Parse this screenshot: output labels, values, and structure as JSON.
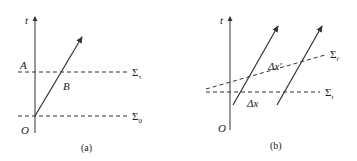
{
  "panels": [
    {
      "id": "a",
      "caption": "(a)",
      "axis_label": "t",
      "origin_label": "O",
      "point_A": "A",
      "point_B": "B",
      "surface_upper": {
        "symbol": "Σ",
        "sub": "τ"
      },
      "surface_lower": {
        "symbol": "Σ",
        "sub": "0"
      }
    },
    {
      "id": "b",
      "caption": "(b)",
      "axis_label": "t",
      "origin_label": "O",
      "delta_x": "Δx",
      "delta_x_prime": "Δx′",
      "surface_tilted": {
        "symbol": "Σ",
        "sub": "t′"
      },
      "surface_flat": {
        "symbol": "Σ",
        "sub": "t"
      }
    }
  ],
  "colors": {
    "line": "#333333",
    "text": "#222222",
    "background": "#ffffff"
  }
}
